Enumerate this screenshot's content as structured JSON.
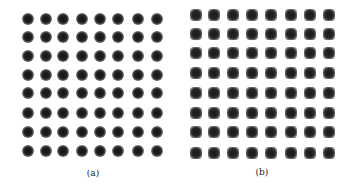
{
  "figure": {
    "panels": [
      {
        "id": "a",
        "caption": "(a)",
        "dot_shape": "round",
        "rows": 8,
        "cols": 8,
        "x_centers": [
          28,
          46,
          63,
          82,
          100,
          118,
          138,
          157
        ],
        "y_centers": [
          19,
          37,
          56,
          75,
          93,
          113,
          132,
          151
        ],
        "caption_pos": [
          93,
          173
        ]
      },
      {
        "id": "b",
        "caption": "(b)",
        "dot_shape": "square",
        "rows": 8,
        "cols": 8,
        "x_centers": [
          196,
          214,
          233,
          252,
          271,
          291,
          310,
          329
        ],
        "y_centers": [
          15,
          34,
          53,
          73,
          93,
          113,
          132,
          153
        ],
        "caption_pos": [
          262,
          172
        ]
      }
    ]
  }
}
